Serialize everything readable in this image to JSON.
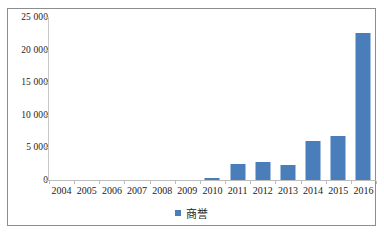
{
  "chart_data": {
    "type": "bar",
    "title": "",
    "xlabel": "",
    "ylabel": "",
    "categories": [
      "2004",
      "2005",
      "2006",
      "2007",
      "2008",
      "2009",
      "2010",
      "2011",
      "2012",
      "2013",
      "2014",
      "2015",
      "2016"
    ],
    "values": [
      0,
      0,
      0,
      0,
      0,
      0,
      250,
      2400,
      2700,
      2300,
      6000,
      6800,
      22500
    ],
    "series": [
      {
        "name": "商誉",
        "color": "#4a7ebb",
        "values": [
          0,
          0,
          0,
          0,
          0,
          0,
          250,
          2400,
          2700,
          2300,
          6000,
          6800,
          22500
        ]
      }
    ],
    "ylim": [
      0,
      25000
    ],
    "ytick_values": [
      0,
      5000,
      10000,
      15000,
      20000,
      25000
    ],
    "ytick_labels": [
      "0",
      "5 000",
      "10 000",
      "15 000",
      "20 000",
      "25 000"
    ],
    "grid": false,
    "legend_position": "bottom",
    "legend_entries": [
      "商誉"
    ]
  },
  "legend": {
    "label": "商誉",
    "swatch_color": "#4a7ebb"
  },
  "colors": {
    "bar": "#4a7ebb",
    "axis": "#c9c9c9",
    "frame": "#8d8d8d",
    "text": "#1c1c1c",
    "background": "#ffffff"
  }
}
